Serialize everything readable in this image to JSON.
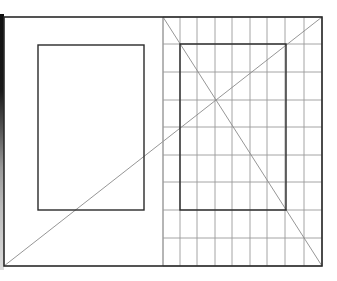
{
  "diagram": {
    "canvas": {
      "width": 337,
      "height": 281,
      "background": "#ffffff"
    },
    "colors": {
      "frame": "#2a2a2a",
      "inner_rect": "#2a2a2a",
      "grid": "#9a9a9a",
      "diagonal": "#8a8a8a",
      "scan_edge": "#111111"
    },
    "outer_frame": {
      "x1": 4,
      "y1": 17,
      "x2": 322,
      "y2": 266,
      "stroke_width": 1.6
    },
    "divider": {
      "x": 163,
      "y1": 17,
      "y2": 266
    },
    "grid": {
      "region": {
        "x1": 163,
        "y1": 17,
        "x2": 322,
        "y2": 266
      },
      "vertical_lines": [
        163,
        180,
        197,
        215,
        232,
        250,
        267,
        285,
        304,
        322
      ],
      "horizontal_lines": [
        17,
        44,
        72,
        100,
        127,
        155,
        182,
        210,
        238,
        266
      ],
      "stroke_width": 0.9
    },
    "left_page_rect": {
      "x1": 38,
      "y1": 45,
      "x2": 144,
      "y2": 210,
      "stroke_width": 1.4
    },
    "right_page_rect": {
      "x1": 180,
      "y1": 44,
      "x2": 286,
      "y2": 210,
      "stroke_width": 1.4
    },
    "diagonals": [
      {
        "name": "spread-diagonal",
        "x1": 4,
        "y1": 266,
        "x2": 322,
        "y2": 17
      },
      {
        "name": "page-diagonal",
        "x1": 163,
        "y1": 17,
        "x2": 322,
        "y2": 266
      }
    ],
    "intersection": {
      "x": 215,
      "y": 100
    }
  }
}
